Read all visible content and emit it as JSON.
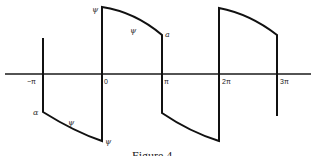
{
  "figure": {
    "caption": "Figure 4",
    "x_axis": {
      "ticks": [
        {
          "label": "−π",
          "x": 43
        },
        {
          "label": "0",
          "x": 102
        },
        {
          "label": "π",
          "x": 162
        },
        {
          "label": "2π",
          "x": 219
        },
        {
          "label": "3π",
          "x": 277
        }
      ]
    },
    "annotations": [
      {
        "label": "ψ",
        "near": "top of jump at 0"
      },
      {
        "label": "ψ",
        "near": "decaying positive segment between 0 and π"
      },
      {
        "label": "a",
        "near": "end of positive segment at π"
      },
      {
        "label": "α",
        "near": "start of negative segment at −π"
      },
      {
        "label": "ψ",
        "near": "negative segment between −π and 0"
      },
      {
        "label": "ψ",
        "near": "bottom of jump at 0"
      }
    ],
    "colors": {
      "line": "#111111",
      "background": "#ffffff"
    }
  },
  "labels": {
    "tick_neg_pi": "−π",
    "tick_zero": "0",
    "tick_pi": "π",
    "tick_2pi": "2π",
    "tick_3pi": "3π",
    "psi_top": "ψ",
    "psi_upper_curve": "ψ",
    "a_label": "a",
    "alpha_label": "α",
    "psi_lower_curve": "ψ",
    "psi_bottom": "ψ",
    "caption": "Figure 4"
  }
}
